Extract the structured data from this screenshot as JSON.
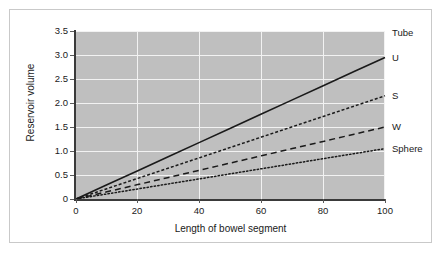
{
  "chart_data": {
    "type": "line",
    "title": "",
    "xlabel": "Length of bowel segment",
    "ylabel": "Reservoir volume",
    "xlim": [
      0,
      100
    ],
    "ylim": [
      0,
      3.5
    ],
    "xticks": [
      "0",
      "20",
      "40",
      "60",
      "80",
      "100"
    ],
    "xtick_values": [
      0,
      20,
      40,
      60,
      80,
      100
    ],
    "yticks": [
      "0",
      "0.5",
      "1.0",
      "1.5",
      "2.0",
      "2.5",
      "3.0",
      "3.5"
    ],
    "ytick_values": [
      0,
      0.5,
      1.0,
      1.5,
      2.0,
      2.5,
      3.0,
      3.5
    ],
    "grid": true,
    "legend_position": "right-inline",
    "plot_background": "#bfbfbf",
    "gridline_color": "#f2f2f2",
    "line_color": "#1a1a1a",
    "x": [
      0,
      10,
      20,
      30,
      40,
      50,
      60,
      70,
      80,
      90,
      100
    ],
    "series": [
      {
        "name": "U",
        "style": "solid",
        "values": [
          0.0,
          0.295,
          0.59,
          0.885,
          1.18,
          1.475,
          1.77,
          2.065,
          2.36,
          2.655,
          2.95
        ]
      },
      {
        "name": "S",
        "style": "fine-dash",
        "values": [
          0.0,
          0.215,
          0.43,
          0.645,
          0.86,
          1.075,
          1.29,
          1.505,
          1.72,
          1.935,
          2.15
        ]
      },
      {
        "name": "W",
        "style": "dashed",
        "values": [
          0.0,
          0.15,
          0.3,
          0.45,
          0.6,
          0.75,
          0.9,
          1.05,
          1.2,
          1.35,
          1.5
        ]
      },
      {
        "name": "Sphere",
        "style": "dotted",
        "values": [
          0.0,
          0.105,
          0.21,
          0.315,
          0.42,
          0.525,
          0.63,
          0.735,
          0.84,
          0.945,
          1.05
        ]
      }
    ],
    "annotations": [
      {
        "text": "Tube",
        "note": "header label above U series, no line drawn"
      }
    ]
  },
  "legend_labels": {
    "tube": "Tube",
    "u": "U",
    "s": "S",
    "w": "W",
    "sphere": "Sphere"
  }
}
